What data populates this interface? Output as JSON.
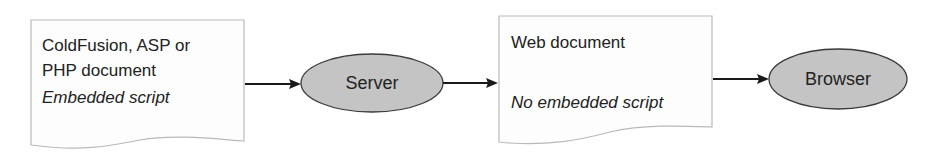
{
  "diagram": {
    "type": "flow",
    "nodes": [
      {
        "id": "source-doc",
        "shape": "document",
        "lines": [
          "ColdFusion, ASP or",
          "PHP document"
        ],
        "subtitle": "Embedded script"
      },
      {
        "id": "server",
        "shape": "ellipse",
        "label": "Server"
      },
      {
        "id": "web-doc",
        "shape": "document",
        "lines": [
          "Web document"
        ],
        "subtitle": "No embedded script"
      },
      {
        "id": "browser",
        "shape": "ellipse",
        "label": "Browser"
      }
    ],
    "edges": [
      {
        "from": "source-doc",
        "to": "server"
      },
      {
        "from": "server",
        "to": "web-doc"
      },
      {
        "from": "web-doc",
        "to": "browser"
      }
    ],
    "colors": {
      "ellipse_fill": "#c4c4c4",
      "ellipse_stroke": "#3a3a3a",
      "doc_fill": "#fdfdfd",
      "doc_stroke": "#b9b9b9",
      "arrow": "#1a1a1a",
      "text": "#222222"
    }
  }
}
